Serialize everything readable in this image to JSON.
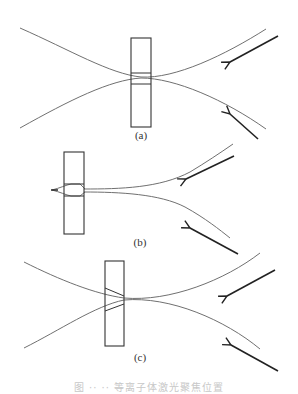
{
  "figure": {
    "panels": [
      {
        "id": "a",
        "label": "(a)"
      },
      {
        "id": "b",
        "label": "(b)"
      },
      {
        "id": "c",
        "label": "(c)"
      }
    ],
    "caption": "图 ·· ·· 等离子体激光聚焦位置"
  },
  "colors": {
    "curve": "#707070",
    "box": "#333333",
    "arrow": "#222222",
    "background": "#ffffff"
  }
}
